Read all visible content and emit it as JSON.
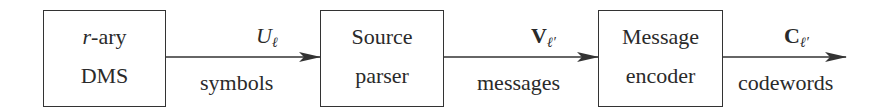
{
  "diagram": {
    "type": "block-diagram",
    "direction": "left-to-right",
    "blocks": [
      {
        "id": "dms",
        "line1_prefix": "r",
        "line1_suffix": "-ary",
        "line2": "DMS"
      },
      {
        "id": "parser",
        "line1": "Source",
        "line2": "parser"
      },
      {
        "id": "encoder",
        "line1": "Message",
        "line2": "encoder"
      }
    ],
    "edges": [
      {
        "from": "dms",
        "to": "parser",
        "symbol_base": "U",
        "symbol_sub": "ℓ",
        "label": "symbols"
      },
      {
        "from": "parser",
        "to": "encoder",
        "symbol_base": "V",
        "symbol_sub": "ℓ′",
        "label": "messages"
      },
      {
        "from": "encoder",
        "to": "output",
        "symbol_base": "C",
        "symbol_sub": "ℓ′",
        "label": "codewords"
      }
    ]
  },
  "colors": {
    "stroke": "#333333",
    "text": "#2a2a2a",
    "background": "#ffffff"
  }
}
